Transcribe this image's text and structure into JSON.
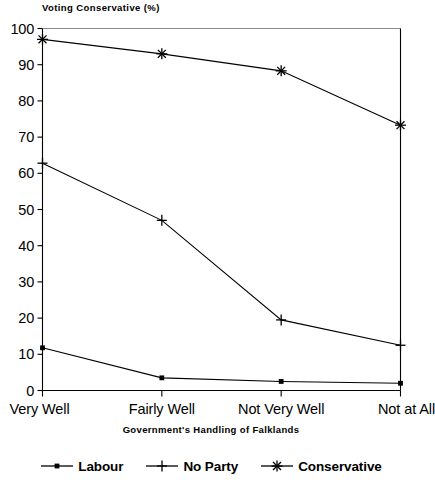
{
  "chart_data": {
    "type": "line",
    "title": "Voting Conservative (%)",
    "xlabel": "Government's Handling of Falklands",
    "ylabel": "",
    "categories": [
      "Very Well",
      "Fairly Well",
      "Not Very Well",
      "Not at All"
    ],
    "series": [
      {
        "name": "Labour",
        "marker": "dot",
        "values": [
          11.8,
          3.5,
          2.5,
          2.0
        ]
      },
      {
        "name": "No Party",
        "marker": "plus",
        "values": [
          62.8,
          47.0,
          19.5,
          12.5
        ]
      },
      {
        "name": "Conservative",
        "marker": "asterisk",
        "values": [
          97.0,
          93.0,
          88.3,
          73.3
        ]
      }
    ],
    "ylim": [
      0,
      100
    ],
    "yticks": [
      0,
      10,
      20,
      30,
      40,
      50,
      60,
      70,
      80,
      90,
      100
    ],
    "ytick_labels": [
      "0",
      "10",
      "20",
      "30",
      "40",
      "50",
      "60",
      "70",
      "80",
      "90",
      "100"
    ],
    "grid": false,
    "legend_position": "bottom",
    "line_color": "#000000",
    "axis_color": "#000000",
    "background_color": "#ffffff"
  },
  "legend": {
    "entries": [
      {
        "label": "Labour",
        "marker": "dot-marker-icon"
      },
      {
        "label": "No Party",
        "marker": "plus-marker-icon"
      },
      {
        "label": "Conservative",
        "marker": "asterisk-marker-icon"
      }
    ]
  }
}
